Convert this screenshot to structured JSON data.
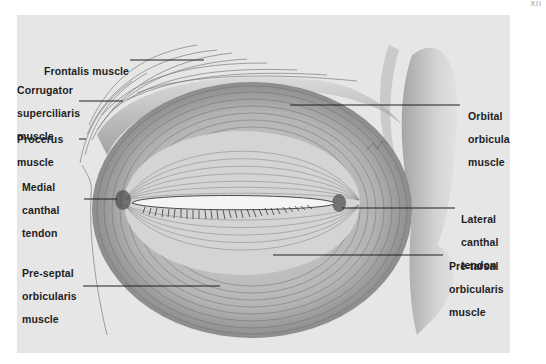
{
  "figure": {
    "corner_mark": "XII",
    "colors": {
      "background": "#ffffff",
      "panel": "#e6e6e6",
      "ink": "#1e1e1e",
      "shading": "#6e6e6e"
    }
  },
  "labels": {
    "frontalis": {
      "lines": [
        "Frontalis muscle"
      ]
    },
    "corrugator": {
      "lines": [
        "Corrugator",
        "superciliaris",
        "muscle"
      ]
    },
    "procerus": {
      "lines": [
        "Procerus",
        "muscle"
      ]
    },
    "medial_canthal": {
      "lines": [
        "Medial",
        "canthal",
        "tendon"
      ]
    },
    "pre_septal": {
      "lines": [
        "Pre-septal",
        "orbicularis",
        "muscle"
      ]
    },
    "orbital": {
      "lines": [
        "Orbital",
        "orbicularis",
        "muscle"
      ]
    },
    "lateral_canthal": {
      "lines": [
        "Lateral",
        "canthal",
        "tendon"
      ]
    },
    "pre_tarsal": {
      "lines": [
        "Pre-tarsal",
        "orbicularis",
        "muscle"
      ]
    }
  }
}
